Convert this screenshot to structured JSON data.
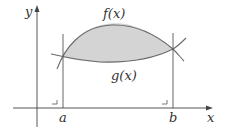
{
  "diagram": {
    "axes": {
      "x_label": "x",
      "y_label": "y"
    },
    "curves": [
      {
        "label": "f(x)",
        "role": "upper"
      },
      {
        "label": "g(x)",
        "role": "lower"
      }
    ],
    "bounds": {
      "left": "a",
      "right": "b"
    },
    "colors": {
      "fill": "#d4d4d4",
      "stroke": "#6a6a6a",
      "axis": "#444444"
    }
  }
}
